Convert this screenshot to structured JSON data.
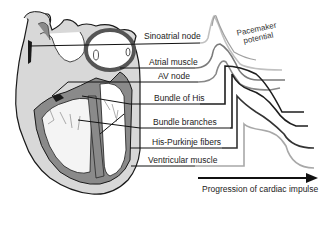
{
  "diagram": {
    "labels": [
      {
        "id": "sa",
        "text": "Sinoatrial node"
      },
      {
        "id": "atrial",
        "text": "Atrial muscle"
      },
      {
        "id": "av",
        "text": "AV node"
      },
      {
        "id": "his",
        "text": "Bundle of His"
      },
      {
        "id": "branches",
        "text": "Bundle branches"
      },
      {
        "id": "purkinje",
        "text": "His-Purkinje fibers"
      },
      {
        "id": "ventricular",
        "text": "Ventricular muscle"
      }
    ],
    "pacemaker_line1": "Pacemaker",
    "pacemaker_line2": "potential",
    "progression_label": "Progression of cardiac impulse",
    "colors": {
      "heart_wall": "#8a8a8a",
      "heart_light": "#d8d8d8",
      "outline": "#1a1a1a",
      "trace_light": "#b0b0b0",
      "trace_mid": "#7a7a7a",
      "trace_dark": "#1e1e1e"
    }
  }
}
